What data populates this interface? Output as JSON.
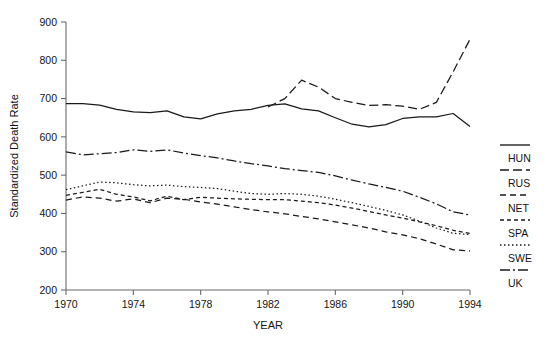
{
  "chart_data": {
    "type": "line",
    "title": "",
    "xlabel": "YEAR",
    "ylabel": "Standardized Death Rate",
    "xlim": [
      1970,
      1994
    ],
    "ylim": [
      200,
      900
    ],
    "xticks": [
      1970,
      1974,
      1978,
      1982,
      1986,
      1990,
      1994
    ],
    "yticks": [
      200,
      300,
      400,
      500,
      600,
      700,
      800,
      900
    ],
    "grid": false,
    "legend_position": "right",
    "x": [
      1970,
      1971,
      1972,
      1973,
      1974,
      1975,
      1976,
      1977,
      1978,
      1979,
      1980,
      1981,
      1982,
      1983,
      1984,
      1985,
      1986,
      1987,
      1988,
      1989,
      1990,
      1991,
      1992,
      1993,
      1994
    ],
    "series": [
      {
        "name": "HUN",
        "style": "solid",
        "dash": "none",
        "values": [
          687,
          687,
          683,
          672,
          665,
          663,
          668,
          652,
          647,
          660,
          668,
          672,
          682,
          686,
          673,
          668,
          650,
          633,
          626,
          632,
          648,
          652,
          652,
          661,
          627
        ]
      },
      {
        "name": "RUS",
        "style": "long-dash",
        "dash": "9,4",
        "values": [
          null,
          null,
          null,
          null,
          null,
          null,
          null,
          null,
          null,
          null,
          null,
          null,
          678,
          700,
          748,
          730,
          700,
          690,
          682,
          684,
          680,
          672,
          690,
          770,
          855
        ]
      },
      {
        "name": "NET",
        "style": "dash",
        "dash": "6,4",
        "values": [
          435,
          443,
          440,
          432,
          438,
          428,
          440,
          437,
          430,
          424,
          417,
          410,
          404,
          399,
          392,
          386,
          378,
          370,
          362,
          352,
          344,
          334,
          320,
          305,
          302
        ]
      },
      {
        "name": "SPA",
        "style": "short-dash",
        "dash": "4,3",
        "values": [
          447,
          455,
          463,
          450,
          443,
          433,
          445,
          436,
          442,
          440,
          438,
          437,
          436,
          436,
          432,
          428,
          422,
          414,
          405,
          396,
          388,
          378,
          368,
          356,
          348
        ]
      },
      {
        "name": "SWE",
        "style": "dotted",
        "dash": "1.5,2.5",
        "values": [
          462,
          472,
          482,
          480,
          475,
          472,
          474,
          470,
          468,
          465,
          458,
          452,
          450,
          452,
          450,
          445,
          437,
          428,
          418,
          408,
          396,
          380,
          362,
          348,
          345
        ]
      },
      {
        "name": "UK",
        "style": "dash-dot",
        "dash": "10,3,2,3",
        "values": [
          561,
          553,
          556,
          559,
          566,
          562,
          566,
          558,
          551,
          545,
          537,
          530,
          524,
          517,
          512,
          507,
          498,
          487,
          477,
          468,
          458,
          442,
          425,
          404,
          396
        ]
      }
    ]
  },
  "legend": {
    "entries": [
      {
        "label": "HUN"
      },
      {
        "label": "RUS"
      },
      {
        "label": "NET"
      },
      {
        "label": "SPA"
      },
      {
        "label": "SWE"
      },
      {
        "label": "UK"
      }
    ]
  }
}
